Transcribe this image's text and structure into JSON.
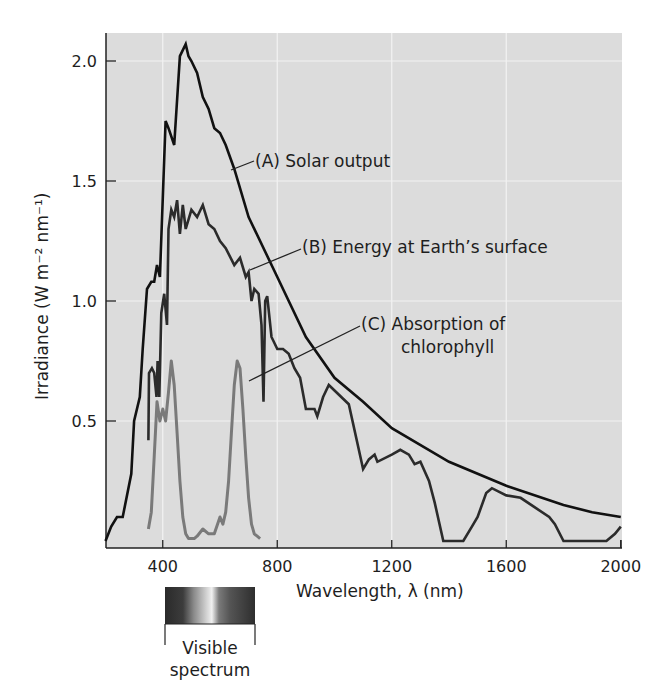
{
  "chart_data": {
    "type": "line",
    "title": "",
    "xlabel": "Wavelength, λ (nm)",
    "ylabel": "Irradiance (W m⁻² nm⁻¹)",
    "xlim": [
      200,
      2000
    ],
    "ylim": [
      0,
      2.1
    ],
    "x_ticks": [
      400,
      800,
      1200,
      1600,
      2000
    ],
    "x_tick_labels": [
      "400",
      "800",
      "1200",
      "1600",
      "2000"
    ],
    "y_ticks": [
      0.5,
      1.0,
      1.5,
      2.0
    ],
    "y_tick_labels": [
      "0.5",
      "1.0",
      "1.5",
      "2.0"
    ],
    "grid": true,
    "legend": "inline annotations",
    "series": [
      {
        "name": "(A) Solar output",
        "color": "#111111",
        "x": [
          200,
          220,
          240,
          260,
          290,
          300,
          320,
          330,
          345,
          360,
          370,
          380,
          390,
          410,
          420,
          440,
          460,
          480,
          490,
          500,
          520,
          540,
          560,
          580,
          600,
          620,
          650,
          700,
          800,
          900,
          1000,
          1100,
          1200,
          1400,
          1600,
          1800,
          1900,
          2000
        ],
        "values": [
          0.0,
          0.06,
          0.1,
          0.1,
          0.28,
          0.5,
          0.6,
          0.8,
          1.05,
          1.08,
          1.08,
          1.15,
          1.1,
          1.75,
          1.72,
          1.65,
          2.02,
          2.07,
          2.02,
          2.0,
          1.95,
          1.85,
          1.8,
          1.72,
          1.7,
          1.65,
          1.55,
          1.35,
          1.1,
          0.85,
          0.68,
          0.58,
          0.47,
          0.33,
          0.23,
          0.15,
          0.12,
          0.1
        ]
      },
      {
        "name": "(B) Energy at Earth's surface",
        "color": "#2b2b2b",
        "x": [
          350,
          352,
          362,
          370,
          378,
          382,
          388,
          395,
          405,
          415,
          420,
          430,
          440,
          450,
          460,
          470,
          480,
          500,
          520,
          540,
          560,
          580,
          600,
          620,
          650,
          670,
          690,
          700,
          710,
          720,
          735,
          745,
          752,
          758,
          765,
          780,
          800,
          820,
          840,
          860,
          880,
          900,
          930,
          940,
          960,
          980,
          1050,
          1100,
          1120,
          1140,
          1150,
          1200,
          1230,
          1260,
          1280,
          1300,
          1330,
          1350,
          1380,
          1400,
          1450,
          1480,
          1500,
          1530,
          1550,
          1600,
          1650,
          1700,
          1750,
          1770,
          1800,
          1850,
          1950,
          1980,
          2000
        ],
        "values": [
          0.42,
          0.7,
          0.72,
          0.7,
          0.6,
          0.75,
          0.6,
          0.95,
          1.03,
          0.9,
          1.3,
          1.38,
          1.35,
          1.42,
          1.28,
          1.4,
          1.3,
          1.38,
          1.35,
          1.4,
          1.32,
          1.3,
          1.25,
          1.22,
          1.15,
          1.18,
          1.1,
          1.12,
          1.0,
          1.05,
          1.03,
          0.9,
          0.58,
          1.0,
          1.02,
          0.85,
          0.8,
          0.8,
          0.78,
          0.72,
          0.68,
          0.55,
          0.55,
          0.52,
          0.6,
          0.65,
          0.57,
          0.3,
          0.34,
          0.36,
          0.33,
          0.36,
          0.38,
          0.36,
          0.32,
          0.33,
          0.25,
          0.16,
          0.0,
          0.0,
          0.0,
          0.06,
          0.1,
          0.2,
          0.22,
          0.19,
          0.18,
          0.14,
          0.1,
          0.07,
          0.0,
          0.0,
          0.0,
          0.03,
          0.06
        ]
      },
      {
        "name": "(C) Absorption of chlorophyll",
        "color": "#7a7a7a",
        "x": [
          350,
          360,
          370,
          380,
          390,
          400,
          410,
          420,
          430,
          440,
          450,
          460,
          470,
          480,
          490,
          500,
          510,
          520,
          540,
          560,
          580,
          600,
          610,
          620,
          630,
          640,
          650,
          660,
          670,
          680,
          690,
          700,
          710,
          720,
          730,
          740
        ],
        "values": [
          0.05,
          0.12,
          0.35,
          0.58,
          0.5,
          0.55,
          0.5,
          0.62,
          0.75,
          0.65,
          0.45,
          0.25,
          0.1,
          0.03,
          0.01,
          0.01,
          0.01,
          0.02,
          0.05,
          0.03,
          0.03,
          0.1,
          0.07,
          0.12,
          0.25,
          0.45,
          0.65,
          0.75,
          0.72,
          0.55,
          0.35,
          0.18,
          0.07,
          0.03,
          0.02,
          0.01
        ]
      }
    ],
    "annotations": [
      {
        "id": "A",
        "text": "(A)  Solar output"
      },
      {
        "id": "B",
        "text": "(B)  Energy at Earth’s surface"
      },
      {
        "id": "C_line1",
        "text": "(C)  Absorption of"
      },
      {
        "id": "C_line2",
        "text": "chlorophyll"
      }
    ],
    "visible_spectrum": {
      "label_line1": "Visible",
      "label_line2": "spectrum",
      "range_nm": [
        380,
        750
      ]
    }
  },
  "colors": {
    "plot_background": "#dcdcdc",
    "grid": "#f2f2f2",
    "axis": "#222222"
  }
}
